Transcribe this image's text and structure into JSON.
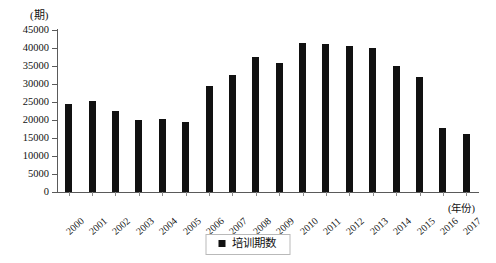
{
  "chart_data": {
    "type": "bar",
    "title": "",
    "subtitle": "",
    "xlabel": "(年份)",
    "ylabel": "(期)",
    "ylim": [
      0,
      45000
    ],
    "ytick_step": 5000,
    "grid": false,
    "legend_position": "bottom-center",
    "series_color": "#111111",
    "categories": [
      "2000",
      "2001",
      "2002",
      "2003",
      "2004",
      "2005",
      "2006",
      "2007",
      "2008",
      "2009",
      "2010",
      "2011",
      "2012",
      "2013",
      "2014",
      "2015",
      "2016",
      "2017"
    ],
    "ytick_labels": [
      "45000",
      "40000",
      "35000",
      "30000",
      "25000",
      "20000",
      "15000",
      "10000",
      "5000",
      "0"
    ],
    "ytick_values": [
      45000,
      40000,
      35000,
      30000,
      25000,
      20000,
      15000,
      10000,
      5000,
      0
    ],
    "series": [
      {
        "name": "培训期数",
        "values": [
          24500,
          25300,
          22600,
          20000,
          20200,
          19500,
          29500,
          32500,
          37500,
          35800,
          41500,
          41000,
          40500,
          40000,
          35000,
          32000,
          17800,
          16000
        ]
      }
    ]
  },
  "legend": {
    "items": [
      {
        "label": "培训期数",
        "color": "#111111",
        "marker": "square-marker"
      }
    ]
  },
  "axes": {
    "y_unit_label": "(期)",
    "x_unit_label": "(年份)"
  }
}
